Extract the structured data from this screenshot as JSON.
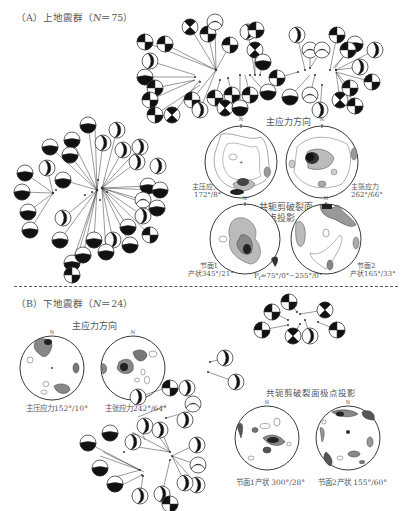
{
  "figure": {
    "panel_a": {
      "title": "（A）上地震群（N＝75）",
      "label_prefix": "（A）上地震群（",
      "n_symbol": "N",
      "n_value": "＝75）",
      "principal_stress_title": "主应力方向",
      "p_axis_label": "主压应力",
      "p_axis_value": "172°/8°",
      "t_axis_label": "主张应力",
      "t_axis_value": "262°/66°",
      "conjugate_title_line1": "共轭剪破裂面",
      "conjugate_title_line2": "极点投影",
      "plane1_label": "节面1",
      "plane1_value": "产状345°/21°",
      "plane2_label": "节面2",
      "plane2_value": "产状165°/33°",
      "pf_label": "P",
      "pf_sub": "f",
      "pf_value": "=75°/0°~255°/0°",
      "north": "N"
    },
    "panel_b": {
      "label_prefix": "（B）下地震群（",
      "n_symbol": "N",
      "n_value": "＝24）",
      "principal_stress_title": "主应力方向",
      "p_axis_caption": "主压应力152°/10°",
      "t_axis_caption": "主张应力242°/64°",
      "conjugate_title": "共轭剪破裂面极点投影",
      "plane1_caption": "节面1产状 300°/28°",
      "plane2_caption": "节面2产状 155°/60°",
      "north": "N"
    },
    "colors": {
      "ink": "#111111",
      "label": "#555555",
      "contour_fill_dark": "#222222",
      "contour_fill_mid": "#888888",
      "contour_fill_light": "#cccccc"
    }
  }
}
